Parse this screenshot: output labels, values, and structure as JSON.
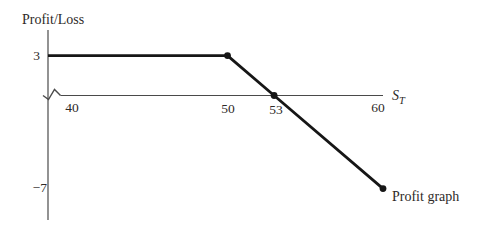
{
  "figure": {
    "background": "#ffffff",
    "line_color": "#161616",
    "axis_color": "#4a4a4a",
    "text_color": "#2e2a28"
  },
  "labels": {
    "ylabel": "Profit/Loss",
    "xlabel_main": "S",
    "xlabel_sub": "T",
    "y_tick_labels": [
      "3",
      "−7"
    ],
    "x_tick_labels": [
      "40",
      "50",
      "53",
      "60"
    ],
    "series_label": "Profit graph"
  },
  "chart_data": {
    "type": "line",
    "title": "",
    "xlabel": "S_T",
    "ylabel": "Profit/Loss",
    "x_ticks": [
      40,
      50,
      53,
      60
    ],
    "y_ticks": [
      3,
      -7
    ],
    "xlim": [
      38.5,
      61
    ],
    "ylim": [
      -9.5,
      5
    ],
    "grid": false,
    "legend_position": "none",
    "axis_break_on_x": true,
    "series": [
      {
        "name": "Profit graph",
        "x": [
          40,
          50,
          53,
          60
        ],
        "y": [
          3,
          3,
          0,
          -7
        ]
      }
    ],
    "marked_points": [
      {
        "x": 50,
        "y": 3
      },
      {
        "x": 53,
        "y": 0
      },
      {
        "x": 60,
        "y": -7
      }
    ]
  }
}
